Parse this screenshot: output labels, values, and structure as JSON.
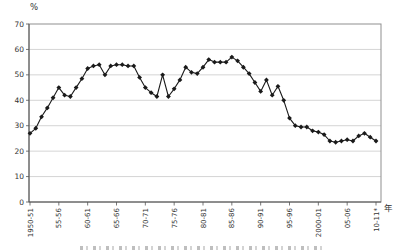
{
  "figure": {
    "y_axis_unit": "%",
    "x_axis_unit": "年",
    "caption_clipped_at_bottom": true
  },
  "chart_data": {
    "type": "line",
    "title": "",
    "xlabel": "年",
    "ylabel": "%",
    "ylim": [
      0,
      70
    ],
    "y_ticks": [
      0,
      10,
      20,
      30,
      40,
      50,
      60,
      70
    ],
    "grid": "horizontal",
    "legend": "none",
    "line_color": "#1a1a1a",
    "marker": "diamond",
    "marker_color": "#1a1a1a",
    "gridline_color": "#c9c9c9",
    "frame_color": "#8f8f8f",
    "axis_color": "#555555",
    "x_tick_labels": [
      "1950-51",
      "55-56",
      "60-61",
      "65-66",
      "70-71",
      "75-76",
      "80-81",
      "85-86",
      "90-91",
      "95-96",
      "2000-01",
      "05-06",
      "10-11*"
    ],
    "x_tick_indices": [
      0,
      5,
      10,
      15,
      20,
      25,
      30,
      35,
      40,
      45,
      50,
      55,
      60
    ],
    "x_years": [
      1950,
      1951,
      1952,
      1953,
      1954,
      1955,
      1956,
      1957,
      1958,
      1959,
      1960,
      1961,
      1962,
      1963,
      1964,
      1965,
      1966,
      1967,
      1968,
      1969,
      1970,
      1971,
      1972,
      1973,
      1974,
      1975,
      1976,
      1977,
      1978,
      1979,
      1980,
      1981,
      1982,
      1983,
      1984,
      1985,
      1986,
      1987,
      1988,
      1989,
      1990,
      1991,
      1992,
      1993,
      1994,
      1995,
      1996,
      1997,
      1998,
      1999,
      2000,
      2001,
      2002,
      2003,
      2004,
      2005,
      2006,
      2007,
      2008,
      2009,
      2010
    ],
    "values": [
      27,
      29,
      33.5,
      37,
      41,
      45,
      42,
      41.5,
      45,
      48.5,
      52.5,
      53.5,
      54,
      50,
      53.5,
      54,
      54,
      53.5,
      53.5,
      49,
      45,
      43,
      41.5,
      50,
      41.5,
      44.5,
      48,
      53,
      51,
      50.5,
      53,
      56,
      55,
      55,
      55,
      57,
      55.5,
      53,
      50.5,
      47,
      43.5,
      48,
      42,
      45.5,
      40,
      33,
      30,
      29.5,
      29.5,
      28,
      27.5,
      26.5,
      24,
      23.5,
      24,
      24.5,
      24,
      26,
      27,
      25.5,
      24
    ]
  }
}
